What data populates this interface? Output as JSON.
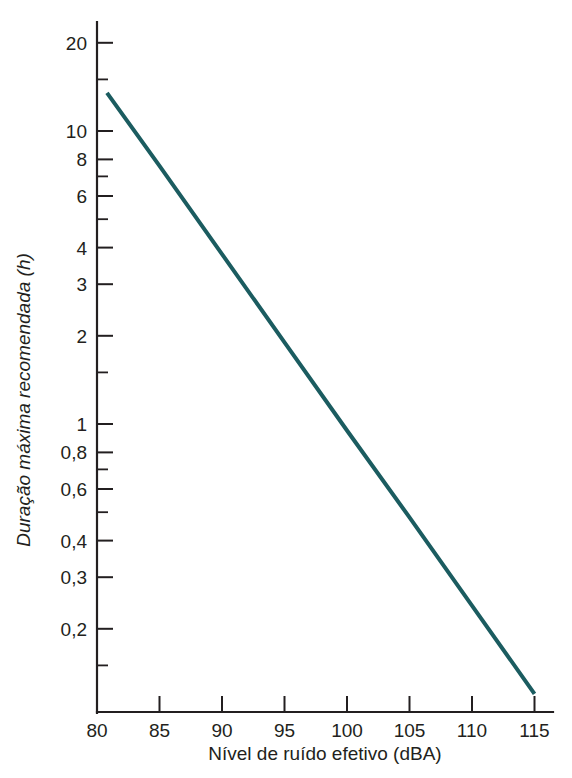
{
  "chart_data": {
    "type": "line",
    "title": "",
    "subtitle": "",
    "xlabel": "Nível de ruído efetivo (dBA)",
    "ylabel": "Duração máxima recomendada (h)",
    "xscale": "linear",
    "yscale": "log",
    "xlim": [
      80,
      116.5
    ],
    "ylim": [
      0.105,
      23
    ],
    "grid": false,
    "legend": null,
    "legend_position": "none",
    "x_ticks": [
      80,
      85,
      90,
      95,
      100,
      105,
      110,
      115
    ],
    "x_tick_labels": [
      "80",
      "85",
      "90",
      "95",
      "100",
      "105",
      "110",
      "115"
    ],
    "y_ticks": [
      20,
      10,
      8,
      6,
      4,
      3,
      2,
      1,
      0.8,
      0.6,
      0.4,
      0.3,
      0.2
    ],
    "y_tick_labels": [
      "20",
      "10",
      "8",
      "6",
      "4",
      "3",
      "2",
      "1",
      "0,8",
      "0,6",
      "0,4",
      "0,3",
      "0,2"
    ],
    "y_minor_ticks": [
      15,
      7,
      5,
      1.5,
      0.7,
      0.5,
      0.15
    ],
    "series": [
      {
        "name": "Duração máxima recomendada",
        "color": "#1b5c60",
        "x": [
          80.8,
          85,
          90,
          95,
          100,
          105,
          110,
          115
        ],
        "y": [
          13.5,
          7.6,
          3.8,
          1.9,
          0.95,
          0.48,
          0.24,
          0.12
        ]
      }
    ],
    "annotations": []
  },
  "axes": {
    "x_axis_name": "x-axis",
    "y_axis_name": "y-axis"
  }
}
